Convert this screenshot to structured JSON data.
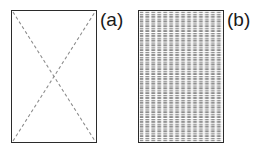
{
  "figure": {
    "background_color": "#ffffff",
    "panels": [
      {
        "id": "a",
        "label": "(a)",
        "kind": "rectangle-with-dashed-diagonals",
        "border_color": "#2b2b2b",
        "fill_color": "#ffffff",
        "line_color": "#8c8c8c",
        "line_style": "dashed",
        "diagonals": [
          {
            "name": "top-left-to-bottom-right",
            "x1": 0,
            "y1": 0,
            "x2": 86,
            "y2": 133
          },
          {
            "name": "bottom-left-to-top-right",
            "x1": 0,
            "y1": 133,
            "x2": 86,
            "y2": 0
          }
        ],
        "crossing_point": {
          "x": 43,
          "y": 66
        }
      },
      {
        "id": "b",
        "label": "(b)",
        "kind": "rectangle-with-dashed-mesh",
        "border_color": "#2b2b2b",
        "fill_color": "#ffffff",
        "mesh_color": "#6e6e6e",
        "mesh_style": "dashed",
        "mesh_columns": 14,
        "mesh_rows": 27,
        "dash_length": 3,
        "dash_gap": 2
      }
    ]
  }
}
